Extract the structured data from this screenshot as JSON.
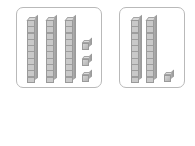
{
  "worksheet": {
    "type": "base-ten-blocks-addition",
    "panels": [
      {
        "name": "left-group",
        "tens_rods": 3,
        "ones_cubes": 3,
        "value": 33
      },
      {
        "name": "right-group",
        "tens_rods": 2,
        "ones_cubes": 1,
        "value": 21
      }
    ],
    "equation": {
      "first_addend": "33+",
      "first_addend_number": 33,
      "second_addend_value": "",
      "second_addend_placeholder": "",
      "equals_symbol": "=",
      "sum_value": "",
      "sum_placeholder": ""
    },
    "colors": {
      "panel_border": "#b9b9b9",
      "block_fill": "#c4c4c4",
      "block_edge": "#9a9a9a",
      "text": "#2b2b2b",
      "input_border": "#9f9f9f",
      "background": "#ffffff"
    },
    "icons": {
      "ten_rod": "ten-rod-block",
      "unit_cube": "unit-cube-block"
    }
  }
}
